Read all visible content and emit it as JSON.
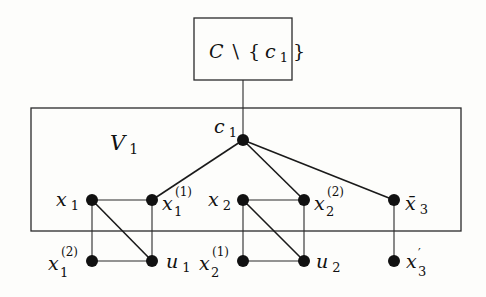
{
  "diagram": {
    "type": "graph-gadget",
    "top_box": {
      "label_main": "C",
      "label_setminus": "\\",
      "label_set_open": "{",
      "label_set_var": "c",
      "label_set_sub": "1",
      "label_set_close": "}"
    },
    "main_box": {
      "label_main": "V",
      "label_sub": "1"
    },
    "nodes": {
      "c1": {
        "main": "c",
        "sub": "1"
      },
      "x1": {
        "main": "x",
        "sub": "1"
      },
      "x1_1": {
        "main": "x",
        "sub": "1",
        "sup": "(1)"
      },
      "x2": {
        "main": "x",
        "sub": "2"
      },
      "x2_2": {
        "main": "x",
        "sub": "2",
        "sup": "(2)"
      },
      "x3bar": {
        "main": "x̄",
        "sub": "3"
      },
      "x1_2": {
        "main": "x",
        "sub": "1",
        "sup": "(2)"
      },
      "u1": {
        "main": "u",
        "sub": "1"
      },
      "x2_1": {
        "main": "x",
        "sub": "2",
        "sup": "(1)"
      },
      "u2": {
        "main": "u",
        "sub": "2"
      },
      "x3prime": {
        "main": "x",
        "sub": "3",
        "sup": "′"
      }
    },
    "edges": [
      [
        "C\\{c1}",
        "c1"
      ],
      [
        "c1",
        "x1_1"
      ],
      [
        "c1",
        "x2_2"
      ],
      [
        "c1",
        "x3bar"
      ],
      [
        "x1",
        "x1_1"
      ],
      [
        "x1",
        "x1_2"
      ],
      [
        "x1",
        "u1"
      ],
      [
        "x1_1",
        "u1"
      ],
      [
        "x1_2",
        "u1"
      ],
      [
        "x2",
        "x2_2"
      ],
      [
        "x2",
        "x2_1"
      ],
      [
        "x2",
        "u2"
      ],
      [
        "x2_2",
        "u2"
      ],
      [
        "x2_1",
        "u2"
      ],
      [
        "x3bar",
        "x3prime"
      ]
    ]
  }
}
